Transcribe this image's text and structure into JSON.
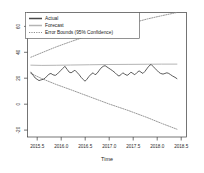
{
  "chart_data": {
    "type": "line",
    "title": "",
    "xlabel": "Time",
    "ylabel": "",
    "xlim": [
      2015.3,
      2018.62
    ],
    "ylim": [
      -28,
      68
    ],
    "grid": false,
    "legend_position": "top-left",
    "xticks": [
      "2015.5",
      "2016.0",
      "2016.5",
      "2017.0",
      "2017.5",
      "2018.0",
      "2018.5"
    ],
    "xtick_values": [
      2015.5,
      2016.0,
      2016.5,
      2017.0,
      2017.5,
      2018.0,
      2018.5
    ],
    "yticks": [
      "60",
      "40",
      "20",
      "0",
      "-20"
    ],
    "ytick_values": [
      60,
      40,
      20,
      0,
      -20
    ],
    "series": [
      {
        "name": "Actual",
        "color": "#4a4a4a",
        "style": "solid",
        "x": [
          2015.37,
          2015.42,
          2015.46,
          2015.5,
          2015.54,
          2015.58,
          2015.63,
          2015.67,
          2015.71,
          2015.75,
          2015.79,
          2015.83,
          2015.88,
          2015.92,
          2015.96,
          2016.0,
          2016.04,
          2016.08,
          2016.13,
          2016.17,
          2016.21,
          2016.25,
          2016.29,
          2016.33,
          2016.38,
          2016.42,
          2016.46,
          2016.5,
          2016.54,
          2016.58,
          2016.63,
          2016.67,
          2016.71,
          2016.75,
          2016.79,
          2016.83,
          2016.88,
          2016.92,
          2016.96,
          2017.0,
          2017.04,
          2017.08,
          2017.13,
          2017.17,
          2017.21,
          2017.25,
          2017.29,
          2017.33,
          2017.38,
          2017.42,
          2017.46,
          2017.5,
          2017.54,
          2017.58,
          2017.63,
          2017.67,
          2017.71,
          2017.75,
          2017.79,
          2017.83,
          2017.88,
          2017.92,
          2017.96,
          2018.0,
          2018.04,
          2018.08,
          2018.13,
          2018.17,
          2018.21,
          2018.25,
          2018.29,
          2018.33,
          2018.38,
          2018.42
        ],
        "values": [
          22.0,
          19.5,
          17.5,
          16.5,
          15.5,
          16.0,
          16.5,
          17.5,
          19.0,
          20.5,
          21.0,
          20.0,
          19.5,
          20.5,
          22.0,
          23.5,
          25.0,
          26.5,
          24.0,
          22.0,
          21.5,
          22.5,
          23.5,
          22.0,
          20.0,
          18.0,
          16.5,
          15.0,
          16.5,
          18.5,
          20.5,
          21.5,
          20.0,
          21.0,
          23.0,
          25.0,
          26.5,
          27.0,
          26.0,
          25.0,
          24.0,
          23.0,
          21.5,
          20.0,
          19.0,
          20.0,
          21.5,
          20.5,
          19.5,
          20.5,
          22.0,
          21.0,
          20.0,
          21.5,
          23.0,
          22.0,
          21.0,
          22.5,
          24.5,
          26.5,
          28.0,
          26.5,
          25.0,
          23.5,
          22.0,
          21.0,
          20.5,
          21.0,
          21.5,
          21.0,
          20.0,
          19.0,
          18.0,
          17.0
        ]
      },
      {
        "name": "Forecast",
        "color": "#b4b4b4",
        "style": "solid",
        "x": [
          2015.37,
          2015.6,
          2015.9,
          2016.2,
          2016.6,
          2017.0,
          2017.4,
          2017.8,
          2018.1,
          2018.42
        ],
        "values": [
          27.4,
          27.2,
          27.3,
          27.5,
          27.7,
          27.9,
          28.0,
          28.1,
          28.2,
          28.2
        ]
      },
      {
        "name": "Error Bounds (95% Confidence)",
        "color": "#8c8c8c",
        "style": "dotted",
        "bound": "upper",
        "x": [
          2015.37,
          2015.6,
          2015.9,
          2016.2,
          2016.6,
          2017.0,
          2017.4,
          2017.8,
          2018.1,
          2018.42
        ],
        "values": [
          33.5,
          37.0,
          41.5,
          45.5,
          50.5,
          55.0,
          59.0,
          63.0,
          65.5,
          68.0
        ]
      },
      {
        "name": "Error Bounds (95% Confidence)",
        "color": "#8c8c8c",
        "style": "dotted",
        "bound": "lower",
        "x": [
          2015.37,
          2015.6,
          2015.9,
          2016.2,
          2016.6,
          2017.0,
          2017.4,
          2017.8,
          2018.1,
          2018.42
        ],
        "values": [
          21.0,
          17.0,
          12.5,
          8.5,
          3.0,
          -2.5,
          -7.5,
          -13.0,
          -17.5,
          -22.0
        ]
      }
    ],
    "legend": [
      {
        "label": "Actual",
        "color": "#4a4a4a",
        "style": "solid"
      },
      {
        "label": "Forecast",
        "color": "#b4b4b4",
        "style": "solid"
      },
      {
        "label": "Error Bounds (95% Confidence)",
        "color": "#8c8c8c",
        "style": "dotted"
      }
    ]
  }
}
